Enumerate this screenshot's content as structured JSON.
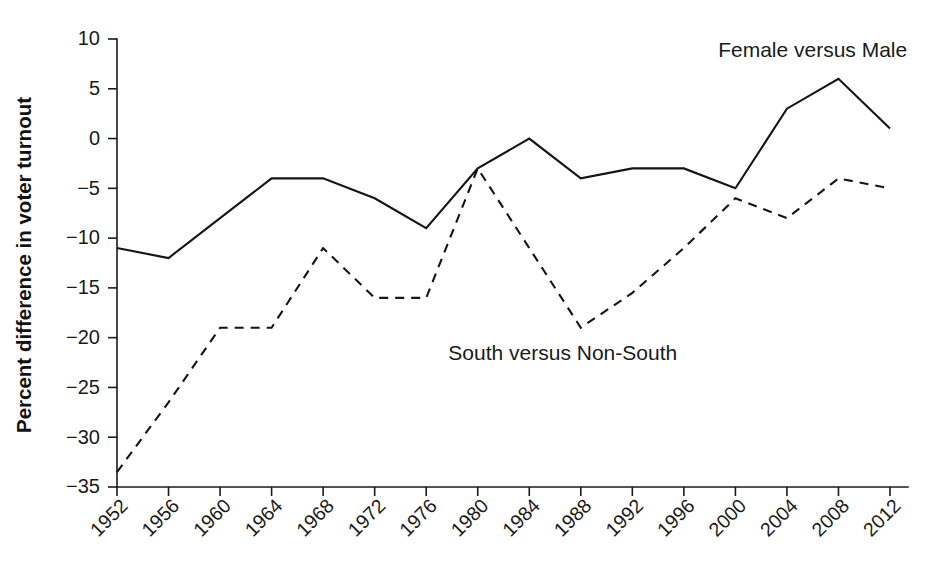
{
  "chart_data": {
    "type": "line",
    "title": "",
    "xlabel": "",
    "ylabel": "Percent difference in voter turnout",
    "categories": [
      1952,
      1956,
      1960,
      1964,
      1968,
      1972,
      1976,
      1980,
      1984,
      1988,
      1992,
      1996,
      2000,
      2004,
      2008,
      2012
    ],
    "xtick_labels": [
      "1952",
      "1956",
      "1960",
      "1964",
      "1968",
      "1972",
      "1976",
      "1980",
      "1984",
      "1988",
      "1992",
      "1996",
      "2000",
      "2004",
      "2008",
      "2012"
    ],
    "ytick_labels": [
      "10",
      "5",
      "0",
      "−5",
      "−10",
      "−15",
      "−20",
      "−25",
      "−30",
      "−35"
    ],
    "ytick_values": [
      10,
      5,
      0,
      -5,
      -10,
      -15,
      -20,
      -25,
      -30,
      -35
    ],
    "ylim": [
      -35,
      10
    ],
    "xlim": [
      1952,
      2012
    ],
    "grid": false,
    "legend_position": "inline-annotation",
    "series": [
      {
        "name": "Female versus Male",
        "style": "solid",
        "color": "#141414",
        "values": [
          -11,
          -12,
          -8,
          -4,
          -4,
          -6,
          -9,
          -3,
          0,
          -4,
          -3,
          -3,
          -5,
          3,
          6,
          1
        ]
      },
      {
        "name": "South versus Non-South",
        "style": "dashed",
        "color": "#141414",
        "values": [
          -33.5,
          -26.5,
          -19,
          -19,
          -11,
          -16,
          -16,
          -3,
          -11,
          -19,
          -15.5,
          -11,
          -6,
          -8,
          -4,
          -5
        ]
      }
    ],
    "annotations": [
      {
        "text": "Female versus Male",
        "x": 2006,
        "y": 8.2
      },
      {
        "text": "South versus Non-South",
        "x": 1986.6,
        "y": -22.2
      }
    ]
  },
  "axes": {
    "y_title": "Percent difference in voter turnout"
  }
}
